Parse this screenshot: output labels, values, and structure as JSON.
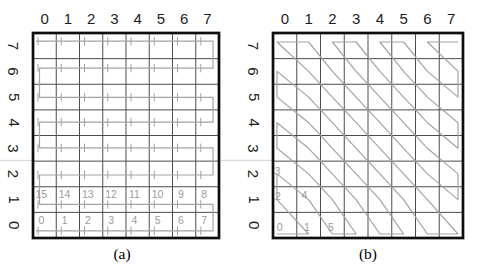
{
  "figure": {
    "colors": {
      "background": "#ffffff",
      "grid": "#4c4c4c",
      "border": "#0d0d0d",
      "path": "#a3a3a3",
      "numbers": "#9b9b9b",
      "axis_labels": "#1c1c1c",
      "caption": "#000000",
      "artifact": "#dcdcdc"
    },
    "panels": [
      {
        "id": "a",
        "caption": "(a)",
        "scan_type": "serpentine",
        "grid": {
          "cols": 8,
          "rows": 8
        },
        "top_axis_labels": [
          "0",
          "1",
          "2",
          "3",
          "4",
          "5",
          "6",
          "7"
        ],
        "left_axis_labels": [
          "7",
          "6",
          "5",
          "4",
          "3",
          "2",
          "1",
          "0"
        ],
        "cell_numbers": [
          {
            "col": 0,
            "row": 0,
            "label": "0"
          },
          {
            "col": 1,
            "row": 0,
            "label": "1"
          },
          {
            "col": 2,
            "row": 0,
            "label": "2"
          },
          {
            "col": 3,
            "row": 0,
            "label": "3"
          },
          {
            "col": 4,
            "row": 0,
            "label": "4"
          },
          {
            "col": 5,
            "row": 0,
            "label": "5"
          },
          {
            "col": 6,
            "row": 0,
            "label": "6"
          },
          {
            "col": 7,
            "row": 0,
            "label": "7"
          },
          {
            "col": 7,
            "row": 1,
            "label": "8"
          },
          {
            "col": 6,
            "row": 1,
            "label": "9"
          },
          {
            "col": 5,
            "row": 1,
            "label": "10"
          },
          {
            "col": 4,
            "row": 1,
            "label": "11"
          },
          {
            "col": 3,
            "row": 1,
            "label": "12"
          },
          {
            "col": 2,
            "row": 1,
            "label": "13"
          },
          {
            "col": 1,
            "row": 1,
            "label": "14"
          },
          {
            "col": 0,
            "row": 1,
            "label": "15"
          }
        ]
      },
      {
        "id": "b",
        "caption": "(b)",
        "scan_type": "zigzag",
        "grid": {
          "cols": 8,
          "rows": 8
        },
        "top_axis_labels": [
          "0",
          "1",
          "2",
          "3",
          "4",
          "5",
          "6",
          "7"
        ],
        "left_axis_labels": [
          "7",
          "6",
          "5",
          "4",
          "3",
          "2",
          "1",
          "0"
        ],
        "cell_numbers": [
          {
            "col": 0,
            "row": 0,
            "label": "0",
            "fx": 0.16,
            "fy": 0.74
          },
          {
            "col": 1,
            "row": 0,
            "label": "1",
            "fx": 0.3,
            "fy": 0.74
          },
          {
            "col": 0,
            "row": 1,
            "label": "2",
            "fx": 0.08,
            "fy": 0.52
          },
          {
            "col": 0,
            "row": 2,
            "label": "3",
            "fx": 0.06,
            "fy": 0.56
          },
          {
            "col": 1,
            "row": 1,
            "label": "4",
            "fx": 0.2,
            "fy": 0.48
          },
          {
            "col": 2,
            "row": 0,
            "label": "5",
            "fx": 0.32,
            "fy": 0.74
          }
        ]
      }
    ]
  }
}
